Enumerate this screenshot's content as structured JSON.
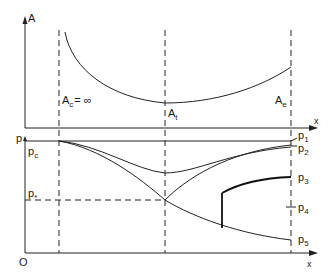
{
  "figure": {
    "area_plot": {
      "y_axis_label": "A",
      "x_axis_label": "x",
      "labels": {
        "inlet": "A",
        "inlet_sub": "c",
        "inlet_value": "= ∞",
        "throat": "A",
        "throat_sub": "t",
        "exit": "A",
        "exit_sub": "e"
      }
    },
    "pressure_plot": {
      "y_axis_label": "p",
      "x_axis_label": "x",
      "origin_label": "O",
      "chamber": {
        "label": "p",
        "sub": "c"
      },
      "critical": {
        "label": "p",
        "sub": "*"
      },
      "back_pressures": [
        {
          "label": "p",
          "sub": "1"
        },
        {
          "label": "p",
          "sub": "2"
        },
        {
          "label": "p",
          "sub": "3"
        },
        {
          "label": "p",
          "sub": "4"
        },
        {
          "label": "p",
          "sub": "5"
        }
      ]
    }
  },
  "colors": {
    "line": "#222222",
    "background": "#ffffff"
  }
}
